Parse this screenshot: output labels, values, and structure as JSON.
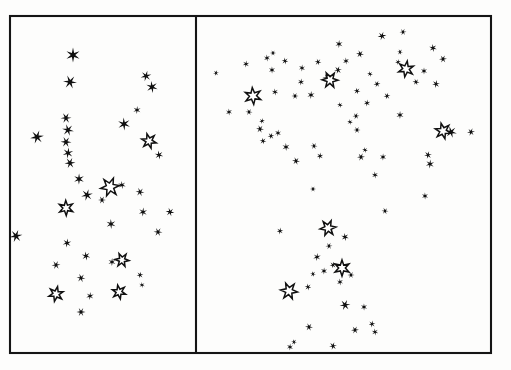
{
  "figure": {
    "background_color": "#fdfdfc",
    "ink_color": "#101010",
    "frame": {
      "x": 10,
      "y": 16,
      "width": 481,
      "height": 337,
      "stroke_width": 2.1
    },
    "divider_x": 196
  },
  "panels": [
    {
      "id": "left-panel",
      "label": "left star field panel",
      "x": 10,
      "y": 16,
      "width": 186,
      "height": 337
    },
    {
      "id": "right-panel",
      "label": "right star field panel",
      "x": 196,
      "y": 16,
      "width": 295,
      "height": 337
    }
  ],
  "legend": {
    "filled_marker": "filled-star",
    "hollow_marker": "hollow-star",
    "filled_count": 98,
    "hollow_count": 13
  },
  "chart_data": {
    "type": "scatter",
    "xlabel": "",
    "ylabel": "",
    "xlim": [
      0,
      511
    ],
    "ylim": [
      0,
      370
    ],
    "grid": false,
    "legend_position": "none",
    "series": [
      {
        "name": "left-panel-filled-stars",
        "marker": "filled-star",
        "points": [
          {
            "x": 73,
            "y": 55,
            "r": 7.5
          },
          {
            "x": 70,
            "y": 82,
            "r": 7.0
          },
          {
            "x": 146,
            "y": 76,
            "r": 5.5
          },
          {
            "x": 152,
            "y": 87,
            "r": 6.0
          },
          {
            "x": 66,
            "y": 118,
            "r": 5.5
          },
          {
            "x": 137,
            "y": 110,
            "r": 4.0
          },
          {
            "x": 68,
            "y": 130,
            "r": 6.0
          },
          {
            "x": 37,
            "y": 137,
            "r": 7.0
          },
          {
            "x": 124,
            "y": 124,
            "r": 6.5
          },
          {
            "x": 66,
            "y": 142,
            "r": 5.5
          },
          {
            "x": 68,
            "y": 153,
            "r": 5.5
          },
          {
            "x": 159,
            "y": 155,
            "r": 4.5
          },
          {
            "x": 70,
            "y": 163,
            "r": 5.5
          },
          {
            "x": 79,
            "y": 179,
            "r": 5.5
          },
          {
            "x": 140,
            "y": 192,
            "r": 4.5
          },
          {
            "x": 87,
            "y": 195,
            "r": 6.0
          },
          {
            "x": 122,
            "y": 185,
            "r": 4.0
          },
          {
            "x": 102,
            "y": 200,
            "r": 4.0
          },
          {
            "x": 143,
            "y": 212,
            "r": 4.5
          },
          {
            "x": 170,
            "y": 212,
            "r": 4.5
          },
          {
            "x": 16,
            "y": 236,
            "r": 6.5
          },
          {
            "x": 111,
            "y": 224,
            "r": 5.0
          },
          {
            "x": 158,
            "y": 232,
            "r": 4.5
          },
          {
            "x": 67,
            "y": 243,
            "r": 4.5
          },
          {
            "x": 86,
            "y": 256,
            "r": 4.5
          },
          {
            "x": 56,
            "y": 265,
            "r": 4.5
          },
          {
            "x": 112,
            "y": 262,
            "r": 4.0
          },
          {
            "x": 81,
            "y": 278,
            "r": 4.5
          },
          {
            "x": 140,
            "y": 275,
            "r": 3.5
          },
          {
            "x": 142,
            "y": 285,
            "r": 3.0
          },
          {
            "x": 81,
            "y": 312,
            "r": 4.5
          },
          {
            "x": 90,
            "y": 296,
            "r": 4.0
          }
        ]
      },
      {
        "name": "left-panel-hollow-stars",
        "marker": "hollow-star",
        "points": [
          {
            "x": 149,
            "y": 141,
            "r": 7.5
          },
          {
            "x": 110,
            "y": 187,
            "r": 9.5
          },
          {
            "x": 66,
            "y": 208,
            "r": 7.5
          },
          {
            "x": 122,
            "y": 260,
            "r": 7.0
          },
          {
            "x": 56,
            "y": 294,
            "r": 7.5
          },
          {
            "x": 119,
            "y": 292,
            "r": 7.0
          }
        ]
      },
      {
        "name": "right-panel-filled-stars",
        "marker": "filled-star",
        "points": [
          {
            "x": 403,
            "y": 32,
            "r": 3.5
          },
          {
            "x": 339,
            "y": 44,
            "r": 4.0
          },
          {
            "x": 360,
            "y": 54,
            "r": 4.0
          },
          {
            "x": 382,
            "y": 36,
            "r": 4.5
          },
          {
            "x": 267,
            "y": 58,
            "r": 3.5
          },
          {
            "x": 273,
            "y": 53,
            "r": 3.0
          },
          {
            "x": 246,
            "y": 64,
            "r": 3.5
          },
          {
            "x": 285,
            "y": 61,
            "r": 3.5
          },
          {
            "x": 216,
            "y": 73,
            "r": 3.0
          },
          {
            "x": 272,
            "y": 70,
            "r": 3.5
          },
          {
            "x": 400,
            "y": 52,
            "r": 3.0
          },
          {
            "x": 398,
            "y": 62,
            "r": 3.0
          },
          {
            "x": 433,
            "y": 48,
            "r": 4.0
          },
          {
            "x": 443,
            "y": 59,
            "r": 4.0
          },
          {
            "x": 302,
            "y": 68,
            "r": 3.5
          },
          {
            "x": 318,
            "y": 62,
            "r": 3.5
          },
          {
            "x": 338,
            "y": 70,
            "r": 4.0
          },
          {
            "x": 346,
            "y": 61,
            "r": 3.5
          },
          {
            "x": 327,
            "y": 78,
            "r": 4.5
          },
          {
            "x": 301,
            "y": 82,
            "r": 3.5
          },
          {
            "x": 370,
            "y": 74,
            "r": 3.0
          },
          {
            "x": 377,
            "y": 84,
            "r": 3.5
          },
          {
            "x": 424,
            "y": 71,
            "r": 3.5
          },
          {
            "x": 416,
            "y": 82,
            "r": 3.5
          },
          {
            "x": 436,
            "y": 84,
            "r": 4.0
          },
          {
            "x": 275,
            "y": 92,
            "r": 3.5
          },
          {
            "x": 295,
            "y": 96,
            "r": 3.5
          },
          {
            "x": 311,
            "y": 95,
            "r": 4.0
          },
          {
            "x": 357,
            "y": 91,
            "r": 3.5
          },
          {
            "x": 387,
            "y": 96,
            "r": 3.5
          },
          {
            "x": 229,
            "y": 112,
            "r": 3.5
          },
          {
            "x": 249,
            "y": 112,
            "r": 3.5
          },
          {
            "x": 367,
            "y": 103,
            "r": 3.5
          },
          {
            "x": 340,
            "y": 105,
            "r": 3.0
          },
          {
            "x": 356,
            "y": 116,
            "r": 3.5
          },
          {
            "x": 400,
            "y": 115,
            "r": 4.0
          },
          {
            "x": 260,
            "y": 129,
            "r": 4.0
          },
          {
            "x": 262,
            "y": 121,
            "r": 3.0
          },
          {
            "x": 350,
            "y": 122,
            "r": 3.0
          },
          {
            "x": 357,
            "y": 130,
            "r": 3.5
          },
          {
            "x": 278,
            "y": 133,
            "r": 3.5
          },
          {
            "x": 263,
            "y": 141,
            "r": 3.5
          },
          {
            "x": 271,
            "y": 136,
            "r": 3.5
          },
          {
            "x": 286,
            "y": 147,
            "r": 4.0
          },
          {
            "x": 314,
            "y": 146,
            "r": 3.5
          },
          {
            "x": 320,
            "y": 156,
            "r": 3.5
          },
          {
            "x": 365,
            "y": 150,
            "r": 3.0
          },
          {
            "x": 361,
            "y": 157,
            "r": 4.0
          },
          {
            "x": 383,
            "y": 157,
            "r": 3.5
          },
          {
            "x": 296,
            "y": 161,
            "r": 4.0
          },
          {
            "x": 428,
            "y": 155,
            "r": 4.0
          },
          {
            "x": 375,
            "y": 175,
            "r": 3.5
          },
          {
            "x": 313,
            "y": 189,
            "r": 3.0
          },
          {
            "x": 430,
            "y": 164,
            "r": 4.5
          },
          {
            "x": 451,
            "y": 132,
            "r": 6.0
          },
          {
            "x": 471,
            "y": 132,
            "r": 4.0
          },
          {
            "x": 425,
            "y": 196,
            "r": 3.5
          },
          {
            "x": 385,
            "y": 211,
            "r": 3.5
          },
          {
            "x": 280,
            "y": 231,
            "r": 3.5
          },
          {
            "x": 345,
            "y": 237,
            "r": 4.0
          },
          {
            "x": 329,
            "y": 246,
            "r": 3.5
          },
          {
            "x": 324,
            "y": 271,
            "r": 3.5
          },
          {
            "x": 313,
            "y": 274,
            "r": 3.0
          },
          {
            "x": 333,
            "y": 265,
            "r": 3.5
          },
          {
            "x": 340,
            "y": 282,
            "r": 3.5
          },
          {
            "x": 351,
            "y": 275,
            "r": 3.5
          },
          {
            "x": 317,
            "y": 257,
            "r": 4.0
          },
          {
            "x": 308,
            "y": 287,
            "r": 3.5
          },
          {
            "x": 345,
            "y": 305,
            "r": 5.5
          },
          {
            "x": 364,
            "y": 307,
            "r": 3.5
          },
          {
            "x": 309,
            "y": 327,
            "r": 4.0
          },
          {
            "x": 372,
            "y": 324,
            "r": 3.5
          },
          {
            "x": 375,
            "y": 332,
            "r": 3.5
          },
          {
            "x": 355,
            "y": 330,
            "r": 4.0
          },
          {
            "x": 290,
            "y": 347,
            "r": 3.5
          },
          {
            "x": 294,
            "y": 342,
            "r": 3.0
          },
          {
            "x": 333,
            "y": 346,
            "r": 4.0
          }
        ]
      },
      {
        "name": "right-panel-hollow-stars",
        "marker": "hollow-star",
        "points": [
          {
            "x": 253,
            "y": 96,
            "r": 8.5
          },
          {
            "x": 330,
            "y": 80,
            "r": 8.0
          },
          {
            "x": 406,
            "y": 69,
            "r": 8.0
          },
          {
            "x": 443,
            "y": 131,
            "r": 8.0
          },
          {
            "x": 328,
            "y": 228,
            "r": 8.0
          },
          {
            "x": 342,
            "y": 268,
            "r": 8.0
          },
          {
            "x": 289,
            "y": 291,
            "r": 8.5
          }
        ]
      }
    ]
  }
}
